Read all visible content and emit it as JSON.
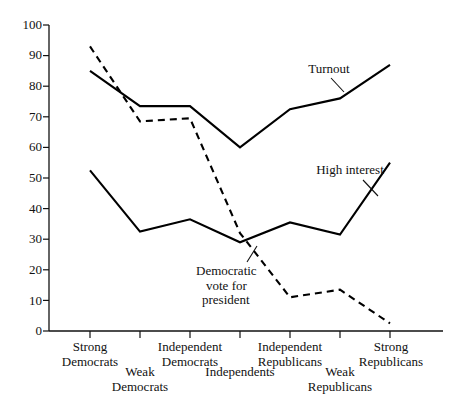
{
  "chart_data": {
    "type": "line",
    "title": "",
    "subtitle": "",
    "xlabel": "",
    "ylabel": "",
    "ylim": [
      0,
      100
    ],
    "yticks": [
      0,
      10,
      20,
      30,
      40,
      50,
      60,
      70,
      80,
      90,
      100
    ],
    "grid": false,
    "legend": "inline-annotations",
    "categories": [
      "Strong Democrats",
      "Weak Democrats",
      "Independent Democrats",
      "Independents",
      "Independent Republicans",
      "Weak Republicans",
      "Strong Republicans"
    ],
    "series": [
      {
        "name": "Turnout",
        "style": "solid",
        "color": "#000000",
        "values": [
          85,
          73.5,
          73.5,
          60,
          72.5,
          76,
          87
        ]
      },
      {
        "name": "Democratic vote for president",
        "style": "dashed",
        "color": "#000000",
        "values": [
          93,
          68.5,
          69.5,
          32,
          11,
          13.5,
          2.5
        ]
      },
      {
        "name": "High interest",
        "style": "solid",
        "color": "#000000",
        "values": [
          52.5,
          32.5,
          36.5,
          29,
          35.5,
          31.5,
          55
        ]
      }
    ],
    "annotations": [
      {
        "id": "turnout",
        "text": "Turnout"
      },
      {
        "id": "high-interest",
        "text": "High interest"
      },
      {
        "id": "dem-vote",
        "line1": "Democratic",
        "line2": "vote for",
        "line3": "president"
      }
    ],
    "xtick_labels": [
      {
        "line1": "Strong",
        "line2": "Democrats",
        "row": 0
      },
      {
        "line1": "Weak",
        "line2": "Democrats",
        "row": 1
      },
      {
        "line1": "Independent",
        "line2": "Democrats",
        "row": 0
      },
      {
        "line1": "Independents",
        "line2": "",
        "row": 1
      },
      {
        "line1": "Independent",
        "line2": "Republicans",
        "row": 0
      },
      {
        "line1": "Weak",
        "line2": "Republicans",
        "row": 1
      },
      {
        "line1": "Strong",
        "line2": "Republicans",
        "row": 0
      }
    ]
  }
}
